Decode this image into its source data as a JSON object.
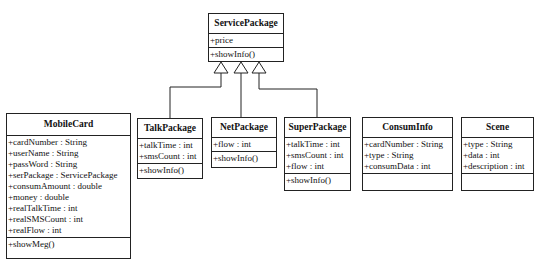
{
  "diagram": {
    "type": "uml-class-diagram",
    "classes": {
      "servicepackage": {
        "name": "ServicePackage",
        "attributes": [
          "+price"
        ],
        "operations": [
          "+showInfo()"
        ]
      },
      "mobilecard": {
        "name": "MobileCard",
        "attributes": [
          "+cardNumber : String",
          "+userName : String",
          "+passWord : String",
          "+serPackage : ServicePackage",
          "+consumAmount : double",
          "+money : double",
          "+realTalkTime : int",
          "+realSMSCount : int",
          "+realFlow : int"
        ],
        "operations": [
          "+showMeg()"
        ]
      },
      "talkpackage": {
        "name": "TalkPackage",
        "attributes": [
          "+talkTime : int",
          "+smsCount : int"
        ],
        "operations": [
          "+showInfo()"
        ]
      },
      "netpackage": {
        "name": "NetPackage",
        "attributes": [
          "+flow : int"
        ],
        "operations": [
          "+showInfo()"
        ]
      },
      "superpackage": {
        "name": "SuperPackage",
        "attributes": [
          "+talkTime : int",
          "+smsCount : int",
          "+flow : int"
        ],
        "operations": [
          "+showInfo()"
        ]
      },
      "consuminfo": {
        "name": "ConsumInfo",
        "attributes": [
          "+cardNumber : String",
          "+type : String",
          "+consumData : int"
        ],
        "operations": []
      },
      "scene": {
        "name": "Scene",
        "attributes": [
          "+type : String",
          "+data : int",
          "+description : int"
        ],
        "operations": []
      }
    },
    "relationships": [
      {
        "type": "generalization",
        "from": "TalkPackage",
        "to": "ServicePackage"
      },
      {
        "type": "generalization",
        "from": "NetPackage",
        "to": "ServicePackage"
      },
      {
        "type": "generalization",
        "from": "SuperPackage",
        "to": "ServicePackage"
      }
    ]
  }
}
